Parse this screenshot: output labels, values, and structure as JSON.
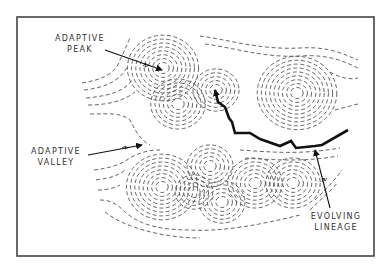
{
  "figure": {
    "type": "adaptive landscape diagram",
    "frame": {
      "x": 17,
      "y": 17,
      "w": 357,
      "h": 239,
      "color": "#444444"
    },
    "labels": {
      "adaptive_peak": {
        "line1": "ADAPTIVE",
        "line2": "PEAK"
      },
      "adaptive_valley": {
        "line1": "ADAPTIVE",
        "line2": "VALLEY"
      },
      "evolving_lineage": {
        "line1": "EVOLVING",
        "line2": "LINEAGE"
      }
    },
    "peaks": [
      {
        "cx": 163,
        "cy": 68,
        "rings": 8
      },
      {
        "cx": 178,
        "cy": 104,
        "rings": 6
      },
      {
        "cx": 216,
        "cy": 90,
        "rings": 5
      },
      {
        "cx": 297,
        "cy": 93,
        "rings": 9
      },
      {
        "cx": 162,
        "cy": 187,
        "rings": 8
      },
      {
        "cx": 194,
        "cy": 192,
        "rings": 4
      },
      {
        "cx": 210,
        "cy": 166,
        "rings": 5
      },
      {
        "cx": 222,
        "cy": 202,
        "rings": 5
      },
      {
        "cx": 255,
        "cy": 183,
        "rings": 6
      },
      {
        "cx": 293,
        "cy": 183,
        "rings": 6
      },
      {
        "cx": 115,
        "cy": 192,
        "rings": 0
      }
    ],
    "lineage_path": [
      [
        348,
        130
      ],
      [
        322,
        145
      ],
      [
        315,
        146
      ],
      [
        296,
        148
      ],
      [
        291,
        141
      ],
      [
        280,
        146
      ],
      [
        260,
        139
      ],
      [
        250,
        133
      ],
      [
        235,
        133
      ],
      [
        232,
        122
      ],
      [
        229,
        118
      ],
      [
        225,
        107
      ],
      [
        218,
        102
      ],
      [
        215,
        90
      ]
    ],
    "colors": {
      "ink": "#111111",
      "contour": "#555555",
      "background": "#ffffff"
    }
  }
}
